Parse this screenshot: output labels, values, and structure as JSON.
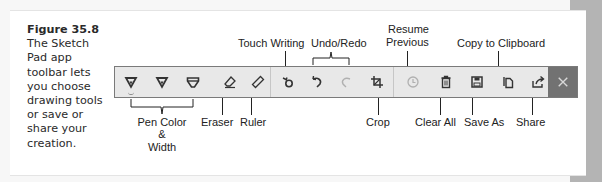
{
  "caption": {
    "figure": "Figure 35.8",
    "text": "The Sketch Pad app toolbar lets you choose drawing tools or save or share your creation."
  },
  "toolbar": {
    "buttons": [
      {
        "name": "pen-1",
        "icon": "pen-icon",
        "selected": true
      },
      {
        "name": "pen-2",
        "icon": "pen-icon"
      },
      {
        "name": "pen-3",
        "icon": "highlighter-icon"
      },
      {
        "name": "eraser",
        "icon": "eraser-icon"
      },
      {
        "name": "ruler",
        "icon": "ruler-icon"
      },
      {
        "name": "touch-writing",
        "icon": "touch-writing-icon"
      },
      {
        "name": "undo",
        "icon": "undo-icon"
      },
      {
        "name": "redo",
        "icon": "redo-icon",
        "disabled": true
      },
      {
        "name": "crop",
        "icon": "crop-icon"
      },
      {
        "name": "resume-previous",
        "icon": "history-icon",
        "disabled": true
      },
      {
        "name": "clear-all",
        "icon": "trash-icon"
      },
      {
        "name": "save-as",
        "icon": "save-icon"
      },
      {
        "name": "copy",
        "icon": "copy-icon"
      },
      {
        "name": "share",
        "icon": "share-icon"
      },
      {
        "name": "close",
        "icon": "close-icon"
      }
    ],
    "colors": {
      "bar": "#e8e8e8",
      "icon": "#333333",
      "disabled": "#b0b0b0",
      "close_bg": "#727272",
      "close_icon": "#d8d8d8"
    }
  },
  "callouts": {
    "touch_writing": "Touch Writing",
    "undo_redo": "Undo/Redo",
    "resume_previous_1": "Resume",
    "resume_previous_2": "Previous",
    "copy_to_clipboard": "Copy to Clipboard",
    "pen_color_1": "Pen Color",
    "pen_color_2": "&",
    "pen_color_3": "Width",
    "eraser": "Eraser",
    "ruler": "Ruler",
    "crop": "Crop",
    "clear_all": "Clear All",
    "save_as": "Save As",
    "share": "Share"
  }
}
